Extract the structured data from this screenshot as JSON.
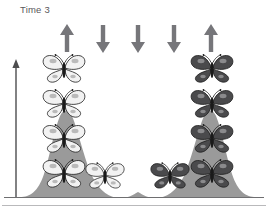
{
  "figure": {
    "title": "Time 3",
    "title_color": "#58585a",
    "curve_fill": "#9a9a9a",
    "axis_color": "#4d4d4f",
    "arrow_color": "#76767a",
    "light_morph_color": "#f2f2f2",
    "dark_morph_color": "#4a4a4c",
    "outline_color": "#1a1a1a"
  },
  "selection_arrows": [
    {
      "id": "arrow-1",
      "direction": "up",
      "x": 56,
      "label": "up-arrow"
    },
    {
      "id": "arrow-2",
      "direction": "down",
      "x": 92,
      "label": "down-arrow"
    },
    {
      "id": "arrow-3",
      "direction": "down",
      "x": 127,
      "label": "down-arrow"
    },
    {
      "id": "arrow-4",
      "direction": "down",
      "x": 163,
      "label": "down-arrow"
    },
    {
      "id": "arrow-5",
      "direction": "up",
      "x": 200,
      "label": "up-arrow"
    }
  ],
  "axes": {
    "y_axis_label": "frequency-axis",
    "x_axis_label": "trait-axis"
  },
  "butterflies": [
    {
      "morph": "light",
      "x": 40,
      "y": 54,
      "w": 48,
      "h": 30
    },
    {
      "morph": "light",
      "x": 40,
      "y": 89,
      "w": 48,
      "h": 30
    },
    {
      "morph": "light",
      "x": 40,
      "y": 124,
      "w": 48,
      "h": 30
    },
    {
      "morph": "light",
      "x": 40,
      "y": 159,
      "w": 48,
      "h": 30
    },
    {
      "morph": "light",
      "x": 83,
      "y": 162,
      "w": 44,
      "h": 28
    },
    {
      "morph": "dark",
      "x": 188,
      "y": 54,
      "w": 48,
      "h": 30
    },
    {
      "morph": "dark",
      "x": 188,
      "y": 89,
      "w": 48,
      "h": 30
    },
    {
      "morph": "dark",
      "x": 188,
      "y": 124,
      "w": 48,
      "h": 30
    },
    {
      "morph": "dark",
      "x": 188,
      "y": 159,
      "w": 48,
      "h": 30
    },
    {
      "morph": "dark",
      "x": 148,
      "y": 162,
      "w": 44,
      "h": 28
    }
  ],
  "chart_data": {
    "type": "area",
    "title": "Time 3",
    "xlabel": "",
    "ylabel": "",
    "x": [
      18,
      26,
      34,
      42,
      50,
      58,
      66,
      74,
      82,
      90,
      98,
      106,
      114,
      122,
      130,
      138,
      146,
      154,
      162,
      170,
      178,
      186,
      194,
      202,
      210,
      218,
      226,
      234,
      242,
      250,
      258
    ],
    "values": [
      0,
      3,
      12,
      38,
      72,
      94,
      100,
      96,
      80,
      56,
      33,
      17,
      8,
      4,
      2,
      1,
      2,
      4,
      8,
      17,
      33,
      56,
      80,
      96,
      100,
      94,
      72,
      38,
      12,
      3,
      0
    ],
    "peaks": [
      {
        "name": "light morph peak",
        "center_x": 66,
        "height": 100
      },
      {
        "name": "dark morph peak",
        "center_x": 210,
        "height": 100
      }
    ],
    "valley": {
      "center_x": 138,
      "height": 1
    },
    "ylim": [
      0,
      110
    ],
    "xlim": [
      10,
      266
    ],
    "grid": false,
    "legend": false,
    "annotations": [
      {
        "text": "Time 3",
        "type": "title"
      },
      {
        "text": "up-arrow",
        "type": "selection-arrow",
        "x": 56
      },
      {
        "text": "down-arrow",
        "type": "selection-arrow",
        "x": 92
      },
      {
        "text": "down-arrow",
        "type": "selection-arrow",
        "x": 127
      },
      {
        "text": "down-arrow",
        "type": "selection-arrow",
        "x": 163
      },
      {
        "text": "up-arrow",
        "type": "selection-arrow",
        "x": 200
      }
    ]
  }
}
